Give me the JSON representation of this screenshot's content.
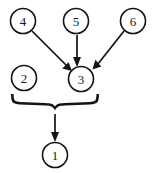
{
  "diagram": {
    "type": "directed-graph-with-brace",
    "background_color": "#ffffff",
    "stroke_color": "#141414",
    "nodes": [
      {
        "id": "n1",
        "label": "1",
        "cx": 55,
        "cy": 155,
        "r": 12.5
      },
      {
        "id": "n2",
        "label": "2",
        "cx": 24,
        "cy": 78,
        "r": 12.5
      },
      {
        "id": "n3",
        "label": "3",
        "cx": 81,
        "cy": 79,
        "r": 12.5
      },
      {
        "id": "n4",
        "label": "4",
        "cx": 23,
        "cy": 21,
        "r": 12.5
      },
      {
        "id": "n5",
        "label": "5",
        "cx": 76,
        "cy": 21,
        "r": 12.5
      },
      {
        "id": "n6",
        "label": "6",
        "cx": 133,
        "cy": 21,
        "r": 12.5
      }
    ],
    "edges": [
      {
        "id": "e4-3",
        "from": "4",
        "to": "3",
        "x1": 32,
        "y1": 31,
        "x2": 70,
        "y2": 69
      },
      {
        "id": "e5-3",
        "from": "5",
        "to": "3",
        "x1": 77,
        "y1": 35,
        "x2": 78,
        "y2": 66
      },
      {
        "id": "e6-3",
        "from": "6",
        "to": "3",
        "x1": 124,
        "y1": 31,
        "x2": 93,
        "y2": 68
      },
      {
        "id": "e-brace-1",
        "from": "brace",
        "to": "1",
        "x1": 55,
        "y1": 114,
        "x2": 55,
        "y2": 141
      }
    ],
    "brace": {
      "id": "brace-2-3",
      "label": "grouping-brace",
      "left_x": 11,
      "right_x": 99,
      "tip_x": 55,
      "top_y": 94,
      "tip_y": 110,
      "groups": [
        "2",
        "3"
      ]
    }
  }
}
